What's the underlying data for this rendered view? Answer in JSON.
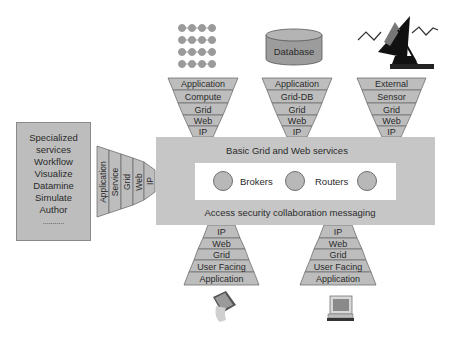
{
  "diagram": {
    "type": "layered grid/web service architecture",
    "colors": {
      "layer_fill": "#bdbdbd",
      "layer_stroke": "#6e6e6e",
      "core_fill": "#c6c6c6",
      "inner_fill": "#ffffff",
      "text": "#2a2a2a"
    },
    "left_box": {
      "lines": [
        "Specialized",
        "services",
        "Workflow",
        "Visualize",
        "Datamine",
        "Simulate",
        "Author",
        "..........."
      ]
    },
    "left_stack": {
      "layers": [
        "Application",
        "Service",
        "Grid",
        "Web",
        "IP"
      ]
    },
    "top_stacks": [
      {
        "icon": "compute-cluster-icon",
        "layers": [
          "Application",
          "Compute",
          "Grid",
          "Web",
          "IP"
        ]
      },
      {
        "icon": "database-icon",
        "icon_label": "Database",
        "layers": [
          "Application",
          "Grid-DB",
          "Grid",
          "Web",
          "IP"
        ]
      },
      {
        "icon": "satellite-sensor-icon",
        "layers": [
          "External",
          "Sensor",
          "Grid",
          "Web",
          "IP"
        ]
      }
    ],
    "core": {
      "title": "Basic Grid and Web services",
      "nodes": [
        "Brokers",
        "Routers"
      ],
      "footer": "Access security collaboration messaging"
    },
    "bottom_stacks": [
      {
        "icon": "pda-device-icon",
        "layers": [
          "IP",
          "Web",
          "Grid",
          "User Facing",
          "Application"
        ]
      },
      {
        "icon": "desktop-computer-icon",
        "layers": [
          "IP",
          "Web",
          "Grid",
          "User Facing",
          "Application"
        ]
      }
    ]
  }
}
